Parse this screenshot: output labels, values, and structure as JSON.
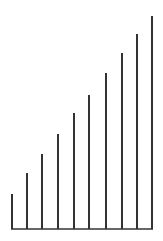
{
  "chart_data": {
    "type": "bar",
    "title": "",
    "xlabel": "",
    "ylabel": "",
    "categories": [
      "1",
      "2",
      "3",
      "4",
      "5",
      "6",
      "7",
      "8",
      "9",
      "10"
    ],
    "values": [
      35,
      56,
      75,
      95,
      116,
      134,
      156,
      176,
      195,
      213
    ],
    "ylim": [
      0,
      241
    ],
    "grid": false,
    "legend": null,
    "style": {
      "line_color": "#333333",
      "bar_width": 2,
      "baseline_y": 229,
      "x_positions": [
        12,
        27,
        42,
        58,
        74,
        89,
        106,
        122,
        137,
        152
      ]
    }
  }
}
